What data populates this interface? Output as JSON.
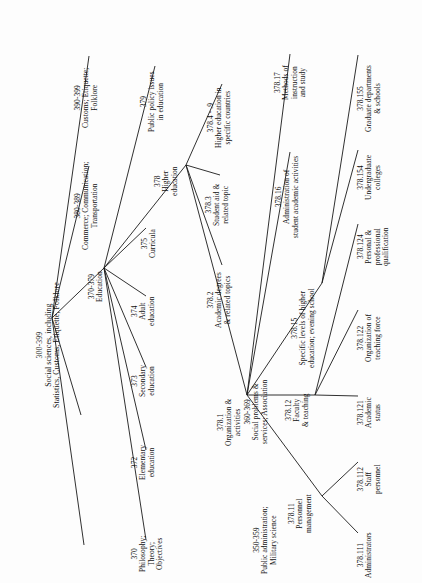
{
  "diagram": {
    "orientation": "rotated-90-ccw",
    "line_color": "#1a1a1a",
    "text_color": "#111111",
    "background": "#ffffff"
  },
  "nodes": [
    {
      "id": "root",
      "code": "300-399",
      "label": "Social sciences, including\nStatistics, Customs, Etiquette, Folklore",
      "x": 52,
      "y": 318,
      "tx": 36,
      "ty": 408,
      "big": true
    },
    {
      "id": "n350",
      "code": "350-359",
      "label": "Public administration;\nMilitary science",
      "x": 84,
      "y": 545,
      "tx": 253,
      "ty": 574
    },
    {
      "id": "n360",
      "code": "360-369",
      "label": "Social problems &\nservices; Association",
      "x": 81,
      "y": 415,
      "tx": 244,
      "ty": 444
    },
    {
      "id": "n370e",
      "code": "370-379",
      "label": "Education",
      "x": 104,
      "y": 268,
      "tx": 88,
      "ty": 302
    },
    {
      "id": "n380",
      "code": "380-389",
      "label": "Commerce; Communication;\nTransportation",
      "x": 89,
      "y": 166,
      "tx": 74,
      "ty": 250
    },
    {
      "id": "n390",
      "code": "390-399",
      "label": "Customs; Etiquette;\nFolklore",
      "x": 89,
      "y": 56,
      "tx": 74,
      "ty": 128
    },
    {
      "id": "n370",
      "code": "370",
      "label": "Philosophy;\nTheory;\nObjectives",
      "x": 146,
      "y": 540,
      "tx": 131,
      "ty": 572
    },
    {
      "id": "n372",
      "code": "372",
      "label": "Elementary\neducation",
      "x": 146,
      "y": 450,
      "tx": 131,
      "ty": 480
    },
    {
      "id": "n373",
      "code": "373",
      "label": "Secondary\neducation",
      "x": 146,
      "y": 367,
      "tx": 131,
      "ty": 397
    },
    {
      "id": "n374",
      "code": "374",
      "label": "Adult\neducation",
      "x": 146,
      "y": 296,
      "tx": 131,
      "ty": 326
    },
    {
      "id": "n375",
      "code": "375",
      "label": "Curricula",
      "x": 146,
      "y": 228,
      "tx": 141,
      "ty": 258
    },
    {
      "id": "n378",
      "code": "378",
      "label": "Higher\neducation",
      "x": 186,
      "y": 165,
      "tx": 154,
      "ty": 196
    },
    {
      "id": "n379",
      "code": "379",
      "label": "Public policy issues\nin education",
      "x": 155,
      "y": 66,
      "tx": 140,
      "ty": 132
    },
    {
      "id": "n3784",
      "code": "378.4 - .9",
      "label": "Higher education in\nspecific countries",
      "x": 222,
      "y": 84,
      "tx": 207,
      "ty": 148
    },
    {
      "id": "n3783",
      "code": "378.3",
      "label": "Student aid &\nrelated topic",
      "x": 220,
      "y": 175,
      "tx": 205,
      "ty": 226
    },
    {
      "id": "n3782",
      "code": "378.2",
      "label": "Academic degrees\n& related topics",
      "x": 222,
      "y": 265,
      "tx": 207,
      "ty": 328
    },
    {
      "id": "n3781",
      "code": "378.1",
      "label": "Organization &\nactivities",
      "x": 247,
      "y": 395,
      "tx": 217,
      "ty": 446
    },
    {
      "id": "n37817",
      "code": "378.17",
      "label": "Methods of\ninstruction\nand study",
      "x": 290,
      "y": 54,
      "tx": 274,
      "ty": 100
    },
    {
      "id": "n37816",
      "code": "378.16",
      "label": "Administration of\nstudent academic activities",
      "x": 290,
      "y": 152,
      "tx": 275,
      "ty": 238
    },
    {
      "id": "n37815",
      "code": "378.15",
      "label": "Specific levels of higher\neducation; evening school",
      "x": 322,
      "y": 283,
      "tx": 291,
      "ty": 368
    },
    {
      "id": "n37812",
      "code": "378.12",
      "label": "Faculty\n& teaching",
      "x": 315,
      "y": 395,
      "tx": 285,
      "ty": 427
    },
    {
      "id": "n37811",
      "code": "378.11",
      "label": "Personnel\nmanagement",
      "x": 322,
      "y": 496,
      "tx": 288,
      "ty": 533
    },
    {
      "id": "n378155",
      "code": "378.155",
      "label": "Graduate departments\n& schools",
      "x": 358,
      "y": 55,
      "tx": 357,
      "ty": 132
    },
    {
      "id": "n378154",
      "code": "378.154",
      "label": "Undergraduate\ncolleges",
      "x": 358,
      "y": 150,
      "tx": 357,
      "ty": 200
    },
    {
      "id": "n378124",
      "code": "378.124",
      "label": "Personal &\nprofessional\nqualification",
      "x": 358,
      "y": 224,
      "tx": 357,
      "ty": 266
    },
    {
      "id": "n378122",
      "code": "378.122",
      "label": "Organization of\nteaching force",
      "x": 358,
      "y": 310,
      "tx": 357,
      "ty": 362
    },
    {
      "id": "n378121",
      "code": "378.121",
      "label": "Academic\nstatus",
      "x": 358,
      "y": 396,
      "tx": 357,
      "ty": 428
    },
    {
      "id": "n378112",
      "code": "378.112",
      "label": "Staff\npersonnel",
      "x": 358,
      "y": 462,
      "tx": 357,
      "ty": 494
    },
    {
      "id": "n378111",
      "code": "378.111",
      "label": "Administrators",
      "x": 358,
      "y": 533,
      "tx": 357,
      "ty": 578
    }
  ],
  "edges": [
    [
      "root",
      "n350"
    ],
    [
      "root",
      "n360"
    ],
    [
      "root",
      "n370e"
    ],
    [
      "root",
      "n380"
    ],
    [
      "root",
      "n390"
    ],
    [
      "n370e",
      "n370"
    ],
    [
      "n370e",
      "n372"
    ],
    [
      "n370e",
      "n373"
    ],
    [
      "n370e",
      "n374"
    ],
    [
      "n370e",
      "n375"
    ],
    [
      "n370e",
      "n378"
    ],
    [
      "n370e",
      "n379"
    ],
    [
      "n378",
      "n3784"
    ],
    [
      "n378",
      "n3783"
    ],
    [
      "n378",
      "n3782"
    ],
    [
      "n378",
      "n3781"
    ],
    [
      "n3781",
      "n37817"
    ],
    [
      "n3781",
      "n37816"
    ],
    [
      "n3781",
      "n37815"
    ],
    [
      "n3781",
      "n37812"
    ],
    [
      "n3781",
      "n37811"
    ],
    [
      "n37815",
      "n378155"
    ],
    [
      "n37815",
      "n378154"
    ],
    [
      "n37812",
      "n378124"
    ],
    [
      "n37812",
      "n378122"
    ],
    [
      "n37812",
      "n378121"
    ],
    [
      "n37811",
      "n378112"
    ],
    [
      "n37811",
      "n378111"
    ]
  ]
}
